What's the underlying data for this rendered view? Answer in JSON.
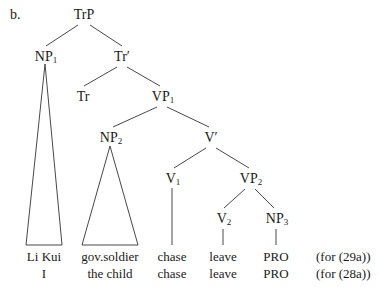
{
  "item_label": "b.",
  "nodes": {
    "trp": {
      "label": "TrP",
      "sub": ""
    },
    "np1": {
      "label": "NP",
      "sub": "1"
    },
    "trbar": {
      "label": "Tr′",
      "sub": ""
    },
    "tr": {
      "label": "Tr",
      "sub": ""
    },
    "vp1": {
      "label": "VP",
      "sub": "1"
    },
    "np2": {
      "label": "NP",
      "sub": "2"
    },
    "vbar": {
      "label": "V′",
      "sub": ""
    },
    "v1": {
      "label": "V",
      "sub": "1"
    },
    "vp2": {
      "label": "VP",
      "sub": "2"
    },
    "v2": {
      "label": "V",
      "sub": "2"
    },
    "np3": {
      "label": "NP",
      "sub": "3"
    }
  },
  "leaves": {
    "row1": [
      "Li Kui",
      "gov.soldier",
      "chase",
      "leave",
      "PRO"
    ],
    "row2": [
      "I",
      "the child",
      "chase",
      "leave",
      "PRO"
    ]
  },
  "notes": {
    "row1": "(for (29a))",
    "row2": "(for (28a))"
  }
}
